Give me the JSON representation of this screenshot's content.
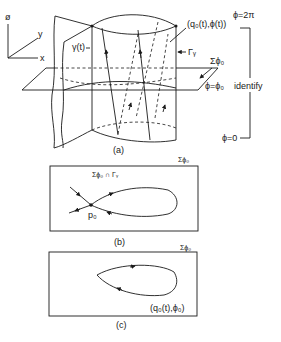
{
  "figure": {
    "panel_a": {
      "caption": "(a)",
      "axes": {
        "phi_axis": "ø",
        "y_axis": "y",
        "x_axis": "x"
      },
      "labels": {
        "gamma_t": "γ(t)",
        "point_label": "(q₀(t),ϕ(t))",
        "Gamma_gamma": "Γᵧ",
        "section": "Σϕ₀",
        "plane_eq": "ϕ=ϕ₀"
      },
      "bracket": {
        "top": "ϕ=2π",
        "middle": "identify",
        "bottom": "ϕ=0"
      }
    },
    "panel_b": {
      "caption": "(b)",
      "section_label": "Σϕ₀",
      "intersection_label": "Σϕ₀ ∩ Γᵧ",
      "point_label": "p₀"
    },
    "panel_c": {
      "caption": "(c)",
      "section_label": "Σϕ₀",
      "curve_label": "(q₀(t),ϕ₀)"
    }
  }
}
